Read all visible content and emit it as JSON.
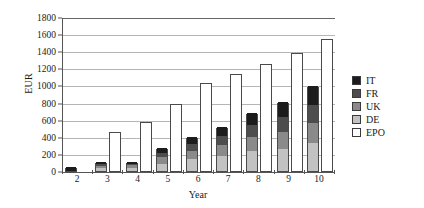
{
  "chart_data": {
    "type": "bar",
    "title": "",
    "subtitle": "",
    "xlabel": "Year",
    "ylabel": "EUR",
    "categories": [
      "2",
      "3",
      "4",
      "5",
      "6",
      "7",
      "8",
      "9",
      "10"
    ],
    "ylim": [
      0,
      1800
    ],
    "yticks": [
      0,
      200,
      400,
      600,
      800,
      1000,
      1200,
      1400,
      1600,
      1800
    ],
    "grid": true,
    "legend_position": "right",
    "stack_order": [
      "DE",
      "UK",
      "FR",
      "IT"
    ],
    "series": [
      {
        "name": "IT",
        "color": "#1c1c1c",
        "values": [
          50,
          25,
          20,
          55,
          85,
          105,
          145,
          180,
          220
        ]
      },
      {
        "name": "FR",
        "color": "#4d4d4d",
        "values": [
          0,
          20,
          20,
          50,
          80,
          100,
          140,
          170,
          215
        ]
      },
      {
        "name": "UK",
        "color": "#8a8a8a",
        "values": [
          0,
          25,
          25,
          75,
          95,
          125,
          165,
          200,
          235
        ]
      },
      {
        "name": "DE",
        "color": "#c2c2c2",
        "values": [
          0,
          35,
          40,
          85,
          135,
          180,
          230,
          260,
          325
        ]
      },
      {
        "name": "EPO",
        "color": "#ffffff",
        "values": [
          0,
          465,
          580,
          800,
          1040,
          1150,
          1260,
          1390,
          1560
        ]
      }
    ],
    "stacked_totals": [
      50,
      105,
      105,
      265,
      395,
      510,
      680,
      810,
      995
    ]
  },
  "legend": {
    "items": [
      {
        "label": "IT"
      },
      {
        "label": "FR"
      },
      {
        "label": "UK"
      },
      {
        "label": "DE"
      },
      {
        "label": "EPO"
      }
    ]
  }
}
